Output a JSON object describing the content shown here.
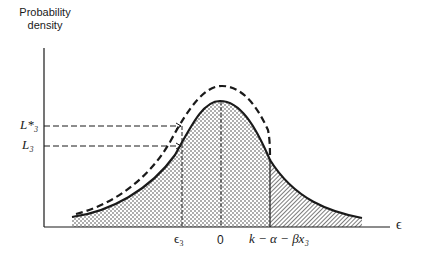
{
  "figure": {
    "y_axis_label_line1": "Probability",
    "y_axis_label_line2": "density",
    "x_axis_label": "ϵ",
    "level_labels": {
      "l_star_3": "L*₃",
      "l_3": "L₃"
    },
    "x_tick_labels": {
      "epsilon_3": "ϵ₃",
      "zero": "0",
      "threshold": "k − α − βx₃"
    },
    "curves": [
      {
        "name": "solid density curve",
        "style": "solid"
      },
      {
        "name": "dashed shifted density curve",
        "style": "dashed"
      }
    ],
    "regions": [
      {
        "name": "left region",
        "fill": "dotted",
        "range": "−∞ to k − α − βx₃"
      },
      {
        "name": "right tail",
        "fill": "hatched",
        "range": "k − α − βx₃ to +∞"
      }
    ],
    "colors": {
      "ink": "#1a1a1a",
      "background": "#ffffff"
    }
  }
}
